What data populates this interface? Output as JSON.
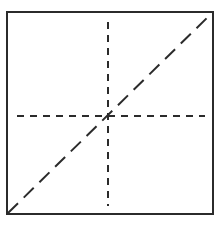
{
  "diagram": {
    "type": "square-with-dashed-lines",
    "colors": {
      "stroke": "#2b2b2b",
      "background": "#ffffff"
    },
    "square": {
      "x": 7,
      "y": 12,
      "width": 206,
      "height": 202,
      "stroke_width": 2
    },
    "lines": [
      {
        "id": "vertical-center",
        "style": "dashed",
        "x1": 108,
        "y1": 22,
        "x2": 108,
        "y2": 206,
        "dash": "7,6"
      },
      {
        "id": "horizontal-center",
        "style": "dashed",
        "x1": 17,
        "y1": 116,
        "x2": 205,
        "y2": 116,
        "dash": "7,6"
      },
      {
        "id": "diagonal",
        "style": "long-dashed",
        "x1": 8,
        "y1": 213,
        "x2": 212,
        "y2": 13,
        "dash": "14,8"
      }
    ]
  }
}
